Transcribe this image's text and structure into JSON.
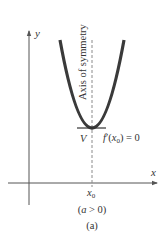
{
  "figure": {
    "axis_x_label": "x",
    "axis_y_label": "y",
    "symmetry_label": "Axis of symmetry",
    "vertex_label": "V",
    "derivative_label_f": "f",
    "derivative_label_prime": "′",
    "derivative_label_open": "(",
    "derivative_label_x": "x",
    "derivative_label_sub": "0",
    "derivative_label_close": ") = 0",
    "x0_label_main": "x",
    "x0_label_sub": "0",
    "condition_open": "(",
    "condition_var": "a",
    "condition_rest": " > 0)",
    "caption": "(a)",
    "colors": {
      "curve": "#3a3a3a",
      "axes": "#555555",
      "dashed": "#8a8a8a",
      "text": "#333333"
    }
  }
}
